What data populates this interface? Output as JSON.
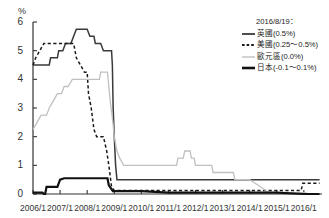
{
  "chart_data": {
    "type": "line",
    "title": "",
    "xlabel": "",
    "ylabel": "%",
    "ylim": [
      0,
      6
    ],
    "xlim": [
      2006.0,
      2016.67
    ],
    "grid": false,
    "legend_position": "right",
    "legend_date": "2016/8/19：",
    "ytick_labels": [
      "0",
      "1",
      "2",
      "3",
      "4",
      "5",
      "6"
    ],
    "ytick_values": [
      0,
      1,
      2,
      3,
      4,
      5,
      6
    ],
    "xtick_labels": [
      "2006/1",
      "2007/1",
      "2008/1",
      "2009/1",
      "2010/1",
      "2011/1",
      "2012/1",
      "2013/1",
      "2014/1",
      "2015/1",
      "2016/1"
    ],
    "xtick_values": [
      2006,
      2007,
      2008,
      2009,
      2010,
      2011,
      2012,
      2013,
      2014,
      2015,
      2016
    ],
    "series": [
      {
        "name": "英國(0.5%)",
        "key": "uk",
        "style": "solid",
        "color": "#3a3a3a",
        "width": 1.5,
        "current_value": 0.5,
        "points": [
          [
            2006.0,
            4.5
          ],
          [
            2006.6,
            4.5
          ],
          [
            2006.65,
            4.75
          ],
          [
            2006.9,
            4.75
          ],
          [
            2006.95,
            5.0
          ],
          [
            2007.1,
            5.0
          ],
          [
            2007.2,
            5.25
          ],
          [
            2007.4,
            5.25
          ],
          [
            2007.5,
            5.5
          ],
          [
            2007.6,
            5.75
          ],
          [
            2007.9,
            5.75
          ],
          [
            2008.0,
            5.75
          ],
          [
            2008.1,
            5.5
          ],
          [
            2008.25,
            5.5
          ],
          [
            2008.3,
            5.25
          ],
          [
            2008.5,
            5.25
          ],
          [
            2008.6,
            5.0
          ],
          [
            2008.9,
            5.0
          ],
          [
            2008.93,
            4.5
          ],
          [
            2008.96,
            3.0
          ],
          [
            2009.0,
            2.0
          ],
          [
            2009.05,
            1.0
          ],
          [
            2009.1,
            0.5
          ],
          [
            2009.3,
            0.5
          ],
          [
            2016.0,
            0.5
          ],
          [
            2016.58,
            0.5
          ]
        ]
      },
      {
        "name": "美國(0.25～0.5%)",
        "key": "us",
        "style": "dashed",
        "color": "#1a1a1a",
        "width": 1.5,
        "current_value": 0.375,
        "points": [
          [
            2006.0,
            4.5
          ],
          [
            2006.1,
            4.75
          ],
          [
            2006.25,
            5.0
          ],
          [
            2006.4,
            5.25
          ],
          [
            2006.55,
            5.25
          ],
          [
            2007.0,
            5.25
          ],
          [
            2007.5,
            5.25
          ],
          [
            2007.6,
            4.75
          ],
          [
            2007.75,
            4.5
          ],
          [
            2007.9,
            4.25
          ],
          [
            2008.0,
            4.25
          ],
          [
            2008.05,
            3.5
          ],
          [
            2008.15,
            3.0
          ],
          [
            2008.25,
            2.25
          ],
          [
            2008.35,
            2.0
          ],
          [
            2008.5,
            2.0
          ],
          [
            2008.6,
            2.0
          ],
          [
            2008.72,
            1.5
          ],
          [
            2008.8,
            1.0
          ],
          [
            2008.9,
            0.25
          ],
          [
            2009.0,
            0.125
          ],
          [
            2009.5,
            0.125
          ],
          [
            2012.0,
            0.125
          ],
          [
            2015.0,
            0.125
          ],
          [
            2015.9,
            0.125
          ],
          [
            2015.96,
            0.375
          ],
          [
            2016.0,
            0.375
          ],
          [
            2016.58,
            0.375
          ]
        ]
      },
      {
        "name": "歐元區(0.0%)",
        "key": "eurozone",
        "style": "solid",
        "color": "#c0c0c0",
        "width": 1.3,
        "current_value": 0.0,
        "points": [
          [
            2006.0,
            2.25
          ],
          [
            2006.15,
            2.5
          ],
          [
            2006.3,
            2.75
          ],
          [
            2006.5,
            2.75
          ],
          [
            2006.6,
            3.0
          ],
          [
            2006.75,
            3.25
          ],
          [
            2006.9,
            3.5
          ],
          [
            2007.05,
            3.5
          ],
          [
            2007.15,
            3.75
          ],
          [
            2007.3,
            3.75
          ],
          [
            2007.45,
            4.0
          ],
          [
            2007.6,
            4.0
          ],
          [
            2008.0,
            4.0
          ],
          [
            2008.45,
            4.0
          ],
          [
            2008.5,
            4.25
          ],
          [
            2008.75,
            4.25
          ],
          [
            2008.8,
            3.75
          ],
          [
            2008.85,
            3.25
          ],
          [
            2008.95,
            2.5
          ],
          [
            2009.0,
            2.0
          ],
          [
            2009.1,
            1.5
          ],
          [
            2009.2,
            1.25
          ],
          [
            2009.35,
            1.0
          ],
          [
            2009.6,
            1.0
          ],
          [
            2010.0,
            1.0
          ],
          [
            2011.0,
            1.0
          ],
          [
            2011.3,
            1.0
          ],
          [
            2011.35,
            1.25
          ],
          [
            2011.55,
            1.25
          ],
          [
            2011.6,
            1.5
          ],
          [
            2011.8,
            1.5
          ],
          [
            2011.85,
            1.25
          ],
          [
            2011.95,
            1.25
          ],
          [
            2012.0,
            1.0
          ],
          [
            2012.6,
            1.0
          ],
          [
            2012.65,
            0.75
          ],
          [
            2013.0,
            0.75
          ],
          [
            2013.4,
            0.75
          ],
          [
            2013.45,
            0.5
          ],
          [
            2013.9,
            0.5
          ],
          [
            2014.0,
            0.5
          ],
          [
            2014.4,
            0.25
          ],
          [
            2014.55,
            0.15
          ],
          [
            2014.7,
            0.05
          ],
          [
            2015.0,
            0.05
          ],
          [
            2016.0,
            0.05
          ],
          [
            2016.2,
            0.0
          ],
          [
            2016.58,
            0.0
          ]
        ]
      },
      {
        "name": "日本(-0.1～0.1%)",
        "key": "japan",
        "style": "solid",
        "color": "#111111",
        "width": 2.2,
        "current_value": 0.0,
        "points": [
          [
            2006.0,
            0.05
          ],
          [
            2006.35,
            0.05
          ],
          [
            2006.4,
            0.0
          ],
          [
            2006.45,
            0.0
          ],
          [
            2006.5,
            0.25
          ],
          [
            2006.62,
            0.25
          ],
          [
            2006.9,
            0.25
          ],
          [
            2007.0,
            0.5
          ],
          [
            2007.15,
            0.55
          ],
          [
            2007.5,
            0.55
          ],
          [
            2008.0,
            0.55
          ],
          [
            2008.5,
            0.55
          ],
          [
            2008.75,
            0.55
          ],
          [
            2008.8,
            0.3
          ],
          [
            2008.95,
            0.1
          ],
          [
            2009.1,
            0.1
          ],
          [
            2010.0,
            0.1
          ],
          [
            2011.0,
            0.05
          ],
          [
            2012.0,
            0.05
          ],
          [
            2013.0,
            0.05
          ],
          [
            2014.0,
            0.05
          ],
          [
            2015.0,
            0.05
          ],
          [
            2016.0,
            0.0
          ],
          [
            2016.58,
            0.0
          ]
        ]
      }
    ]
  },
  "axis": {
    "unit_label": "%"
  },
  "legend": {
    "date": "2016/8/19：",
    "entries": [
      {
        "label": "英國(0.5%)",
        "style": "solid",
        "color": "#3a3a3a",
        "width": 1.8
      },
      {
        "label": "美國(0.25～0.5%)",
        "style": "dashed",
        "color": "#1a1a1a",
        "width": 1.8
      },
      {
        "label": "歐元區(0.0%)",
        "style": "solid",
        "color": "#c0c0c0",
        "width": 1.4
      },
      {
        "label": "日本(-0.1～0.1%)",
        "style": "solid",
        "color": "#111111",
        "width": 2.6
      }
    ]
  }
}
